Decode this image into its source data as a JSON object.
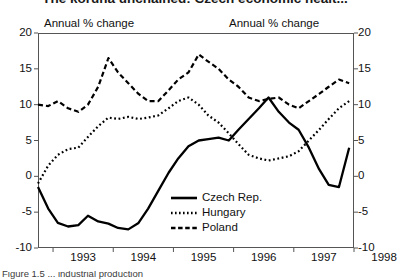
{
  "title": "The koruna unchained: Czech economic healt...",
  "caption": "Figure 1.5 ... industrial production",
  "axis_caption_left": "Annual % change",
  "axis_caption_right": "Annual % change",
  "legend": [
    {
      "label": "Czech Rep.",
      "style": "solid"
    },
    {
      "label": "Hungary",
      "style": "dotted"
    },
    {
      "label": "Poland",
      "style": "dashed"
    }
  ],
  "y_ticks_left": [
    "20",
    "15",
    "10",
    "5",
    "0",
    "-5",
    "-10"
  ],
  "y_ticks_right": [
    "20",
    "15",
    "10",
    "5",
    "0",
    "-5",
    "-10"
  ],
  "x_ticks": [
    "1993",
    "1994",
    "1995",
    "1996",
    "1997",
    "1998"
  ],
  "chart_data": {
    "type": "line",
    "title": "The koruna unchained: Czech economic healt...",
    "xlabel": "",
    "ylabel": "Annual % change",
    "ylim": [
      -10,
      20
    ],
    "xlim": [
      1992.75,
      1998.0
    ],
    "yticks": [
      -10,
      -5,
      0,
      5,
      10,
      15,
      20
    ],
    "xticks": [
      1993,
      1994,
      1995,
      1996,
      1997,
      1998
    ],
    "grid": false,
    "legend_position": "inside-bottom-center",
    "annotations": [
      "Annual % change",
      "Annual % change"
    ],
    "x": [
      1992.75,
      1992.92,
      1993.08,
      1993.25,
      1993.42,
      1993.58,
      1993.75,
      1993.92,
      1994.08,
      1994.25,
      1994.42,
      1994.58,
      1994.75,
      1994.92,
      1995.08,
      1995.25,
      1995.42,
      1995.58,
      1995.75,
      1995.92,
      1996.08,
      1996.25,
      1996.42,
      1996.58,
      1996.75,
      1996.92,
      1997.08,
      1997.25,
      1997.42,
      1997.58,
      1997.75,
      1997.92
    ],
    "series": [
      {
        "name": "Czech Rep.",
        "style": "solid",
        "values": [
          -1.5,
          -4.5,
          -6.5,
          -7.0,
          -6.8,
          -5.5,
          -6.3,
          -6.6,
          -7.2,
          -7.4,
          -6.5,
          -4.5,
          -2.0,
          0.5,
          2.5,
          4.2,
          5.0,
          5.2,
          5.4,
          5.0,
          6.5,
          8.0,
          9.5,
          11.0,
          9.0,
          7.5,
          6.5,
          4.0,
          1.0,
          -1.2,
          -1.5,
          4.0
        ]
      },
      {
        "name": "Hungary",
        "style": "dotted",
        "values": [
          -1.0,
          1.5,
          3.0,
          3.8,
          4.0,
          5.5,
          7.0,
          8.2,
          8.0,
          8.3,
          8.0,
          8.2,
          8.5,
          9.5,
          10.5,
          11.0,
          10.0,
          8.5,
          7.5,
          6.0,
          4.5,
          3.0,
          2.5,
          2.2,
          2.5,
          2.8,
          3.5,
          5.0,
          6.5,
          8.0,
          9.5,
          10.5
        ]
      },
      {
        "name": "Poland",
        "style": "dashed",
        "values": [
          10.0,
          9.8,
          10.5,
          9.5,
          9.0,
          10.0,
          12.5,
          16.5,
          14.5,
          13.0,
          11.5,
          10.5,
          10.5,
          12.0,
          13.5,
          14.5,
          17.0,
          16.0,
          15.0,
          13.5,
          12.5,
          11.0,
          10.5,
          10.8,
          11.0,
          10.0,
          9.5,
          10.5,
          11.5,
          12.5,
          13.5,
          13.0
        ]
      }
    ]
  }
}
